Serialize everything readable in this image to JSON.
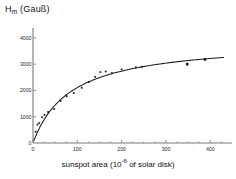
{
  "figure": {
    "y_axis_label_main": "H",
    "y_axis_label_sub": "m",
    "y_axis_label_unit": "(Gauß)",
    "x_axis_label_pre": "sunspot area (10",
    "x_axis_label_sup": "-6",
    "x_axis_label_post": " of  solar disk)"
  },
  "chart_data": {
    "type": "scatter",
    "title": "",
    "xlabel": "sunspot area (10^-6 of solar disk)",
    "ylabel": "H_m (Gauß)",
    "xlim": [
      0,
      440
    ],
    "ylim": [
      0,
      4300
    ],
    "xticks": [
      0,
      100,
      200,
      300,
      400
    ],
    "xtick_labels": [
      "0",
      "100",
      "200",
      "300",
      "400"
    ],
    "xticks_minor_step": 25,
    "yticks": [
      0,
      1000,
      2000,
      3000,
      4000
    ],
    "ytick_labels": [
      "0",
      "1000",
      "2000",
      "3000",
      "4000"
    ],
    "grid": false,
    "legend": null,
    "series": [
      {
        "name": "observations",
        "marker": "square",
        "x": [
          6,
          10,
          14,
          20,
          26,
          34,
          48,
          62,
          76,
          92,
          110,
          126,
          140,
          152,
          164,
          178,
          200,
          232,
          246,
          348,
          388
        ],
        "y": [
          430,
          700,
          760,
          980,
          1070,
          1180,
          1290,
          1600,
          1780,
          1900,
          2100,
          2320,
          2520,
          2700,
          2720,
          2660,
          2800,
          2880,
          2900,
          3000,
          3180
        ]
      },
      {
        "name": "fitted saturation curve",
        "type": "line",
        "equation": "H = Hinf * A / (A + A0)",
        "Hinf": 3900,
        "A0": 85,
        "x_range": [
          2,
          430
        ]
      }
    ]
  }
}
